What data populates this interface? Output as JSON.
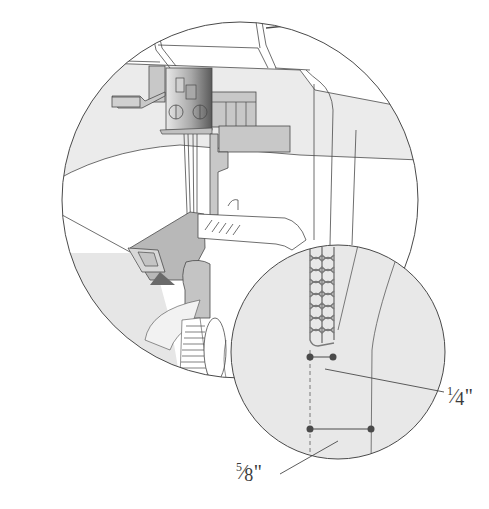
{
  "diagram": {
    "colors": {
      "line": "#4a4a4a",
      "fabric": "#e6e6e6",
      "machine_light": "#ececec",
      "machine_mid": "#c8c8c8",
      "machine_dark": "#707070",
      "arrow": "#6a6a6a",
      "stitch": "#7a7a7a",
      "dot": "#4a4a4a"
    },
    "views": [
      {
        "name": "main-circle",
        "description": "serger needle and presser foot area"
      },
      {
        "name": "detail-circle",
        "description": "magnified overlock stitch with seam allowance markers"
      }
    ],
    "labels": {
      "quarter_inch": {
        "num": "1",
        "den": "4",
        "unit": "\""
      },
      "five_eighths_inch": {
        "num": "5",
        "den": "8",
        "unit": "\""
      }
    }
  }
}
